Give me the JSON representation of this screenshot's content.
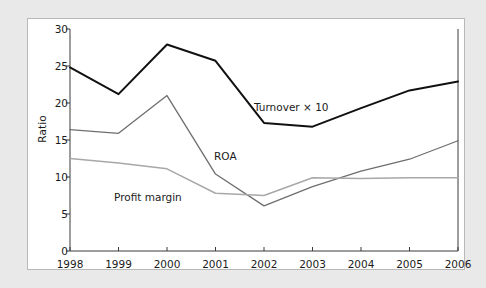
{
  "figure": {
    "background_color": "#e9e9e9",
    "panel_color": "#ffffff",
    "border_color": "#b8b8b8"
  },
  "chart_data": {
    "type": "line",
    "title": "",
    "xlabel": "",
    "ylabel": "Ratio",
    "x": [
      1998,
      1999,
      2000,
      2001,
      2002,
      2003,
      2004,
      2005,
      2006
    ],
    "categories": [
      "1998",
      "1999",
      "2000",
      "2001",
      "2002",
      "2003",
      "2004",
      "2005",
      "2006"
    ],
    "xlim": [
      1998,
      2006
    ],
    "ylim": [
      0,
      30
    ],
    "yticks": [
      0,
      5,
      10,
      15,
      20,
      25,
      30
    ],
    "ytick_labels": [
      "0",
      "5",
      "10",
      "15",
      "20",
      "25",
      "30"
    ],
    "grid": false,
    "legend": "inline-labels",
    "series": [
      {
        "name": "Turnover × 10",
        "color": "#111111",
        "line_width": 2.0,
        "label_position": "inline",
        "values": [
          24.8,
          21.2,
          27.9,
          25.7,
          17.3,
          16.8,
          19.3,
          21.7,
          22.9
        ]
      },
      {
        "name": "ROA",
        "color": "#6e6e6e",
        "line_width": 1.3,
        "label_position": "inline",
        "values": [
          16.4,
          15.9,
          21.0,
          10.4,
          6.1,
          8.7,
          10.8,
          12.4,
          14.9
        ]
      },
      {
        "name": "Profit margin",
        "color": "#a8a8a8",
        "line_width": 1.5,
        "label_position": "inline",
        "values": [
          12.5,
          11.9,
          11.1,
          7.8,
          7.5,
          9.9,
          9.8,
          9.9,
          9.9
        ]
      }
    ],
    "annotations": [
      {
        "text": "Turnover × 10",
        "series": "Turnover × 10"
      },
      {
        "text": "ROA",
        "series": "ROA"
      },
      {
        "text": "Profit margin",
        "series": "Profit margin"
      }
    ]
  }
}
